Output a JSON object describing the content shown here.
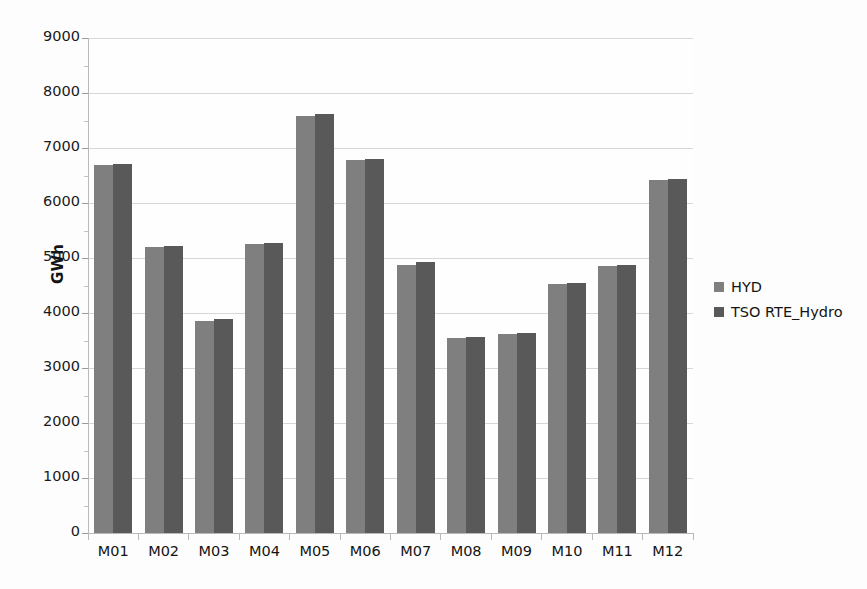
{
  "chart_data": {
    "type": "bar",
    "title": "",
    "xlabel": "",
    "ylabel": "GWh",
    "categories": [
      "M01",
      "M02",
      "M03",
      "M04",
      "M05",
      "M06",
      "M07",
      "M08",
      "M09",
      "M10",
      "M11",
      "M12"
    ],
    "series": [
      {
        "name": "HYD",
        "color": "#7f7f7f",
        "values": [
          6690,
          5200,
          3860,
          5260,
          7590,
          6780,
          4880,
          3540,
          3610,
          4520,
          4850,
          6410
        ]
      },
      {
        "name": "TSO RTE_Hydro",
        "color": "#595959",
        "values": [
          6710,
          5220,
          3900,
          5280,
          7620,
          6800,
          4920,
          3560,
          3640,
          4540,
          4880,
          6430
        ]
      }
    ],
    "ylim": [
      0,
      9000
    ],
    "ytick_values": [
      0,
      1000,
      2000,
      3000,
      4000,
      5000,
      6000,
      7000,
      8000,
      9000
    ],
    "ytick_labels": [
      "0",
      "1000",
      "2000",
      "3000",
      "4000",
      "5000",
      "6000",
      "7000",
      "8000",
      "9000"
    ],
    "grid": true,
    "legend_position": "right",
    "legend": [
      "HYD",
      "TSO RTE_Hydro"
    ]
  },
  "legend": {
    "items": [
      {
        "label": "HYD"
      },
      {
        "label": "TSO RTE_Hydro"
      }
    ]
  },
  "axes": {
    "y_axis_title": "GWh"
  }
}
